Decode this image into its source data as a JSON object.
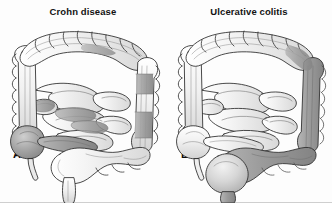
{
  "figure": {
    "kind": "medical-illustration",
    "background_color": "#fdfdfd",
    "border_color": "#cfcfcf"
  },
  "panels": [
    {
      "letter": "A",
      "title": "Crohn disease",
      "pattern": "patchy skip lesions",
      "affected_segments": [
        "terminal ileum",
        "cecum",
        "scattered small bowel loops",
        "patchy descending colon",
        "patchy transverse colon"
      ],
      "shade_color": "#9a9a9a"
    },
    {
      "letter": "B",
      "title": "Ulcerative colitis",
      "pattern": "continuous involvement",
      "affected_segments": [
        "rectum",
        "sigmoid colon",
        "descending colon",
        "distal transverse colon"
      ],
      "shade_color": "#9a9a9a"
    }
  ],
  "colors": {
    "outline": "#2b2b2b",
    "bowel_light": "#f2f2f2",
    "bowel_mid": "#e0e0e0",
    "diseased_dark": "#a0a0a0",
    "diseased_darker": "#8c8c8c",
    "text": "#131313",
    "page_background": "#ffffff"
  }
}
